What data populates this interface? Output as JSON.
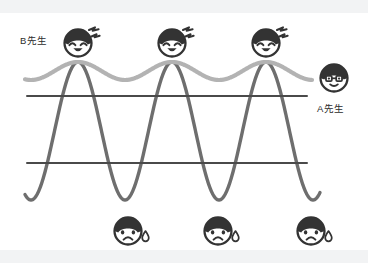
{
  "diagram": {
    "background_color": "#ffffff",
    "edge_band_color": "#f2f3f4"
  },
  "labels": {
    "teacher_b": "B先生",
    "teacher_a": "A先生"
  },
  "colors": {
    "wave_large": "#6e6e6e",
    "wave_small": "#b3b3b3",
    "reference_line": "#4a4a4a",
    "face_ink": "#333333",
    "face_fill": "#ffffff",
    "sweat_drop": "#ffffff",
    "text": "#2c2c2c"
  },
  "chart_data": {
    "type": "line",
    "title": "",
    "xlabel": "",
    "ylabel": "",
    "xlim": [
      0,
      368
    ],
    "ylim": [
      0,
      263
    ],
    "grid": false,
    "legend": [
      "B先生",
      "A先生"
    ],
    "legend_position": "inline-annotations",
    "series": [
      {
        "name": "B先生",
        "role": "large-amplitude-wave",
        "color": "#6e6e6e",
        "stroke_width": 3.4,
        "amplitude_px": 69,
        "period_px": 94,
        "midline_y": 131,
        "peak_y": 62,
        "trough_y": 200,
        "x_start": 25,
        "x_end": 320,
        "peak_x": [
          78,
          172,
          266
        ],
        "trough_x": [
          125,
          219,
          313
        ]
      },
      {
        "name": "A先生",
        "role": "small-amplitude-wave",
        "color": "#b3b3b3",
        "stroke_width": 4.2,
        "amplitude_px": 9,
        "period_px": 94,
        "midline_y": 71,
        "peak_y": 62,
        "trough_y": 80,
        "x_start": 25,
        "x_end": 312,
        "peak_x": [
          78,
          172,
          266
        ],
        "trough_x": [
          125,
          219
        ]
      }
    ],
    "reference_lines": [
      {
        "name": "upper-reference-line",
        "y": 96,
        "x_start": 27,
        "x_end": 307,
        "color": "#4a4a4a"
      },
      {
        "name": "lower-reference-line",
        "y": 163,
        "x_start": 27,
        "x_end": 307,
        "color": "#4a4a4a"
      }
    ],
    "annotations": [
      {
        "name": "happy-face-peak-1",
        "type": "happy-face",
        "x": 78,
        "y": 43,
        "has_excitement_marks": true
      },
      {
        "name": "happy-face-peak-2",
        "type": "happy-face",
        "x": 172,
        "y": 43,
        "has_excitement_marks": true
      },
      {
        "name": "happy-face-peak-3",
        "type": "happy-face",
        "x": 266,
        "y": 43,
        "has_excitement_marks": true
      },
      {
        "name": "sad-face-trough-1",
        "type": "sad-face",
        "x": 128,
        "y": 231,
        "has_sweat_drop": true
      },
      {
        "name": "sad-face-trough-2",
        "type": "sad-face",
        "x": 218,
        "y": 231,
        "has_sweat_drop": true
      },
      {
        "name": "sad-face-trough-3",
        "type": "sad-face",
        "x": 311,
        "y": 231,
        "has_sweat_drop": true
      },
      {
        "name": "glasses-face-a",
        "type": "glasses-face",
        "x": 334,
        "y": 78,
        "has_glasses": true
      }
    ]
  }
}
